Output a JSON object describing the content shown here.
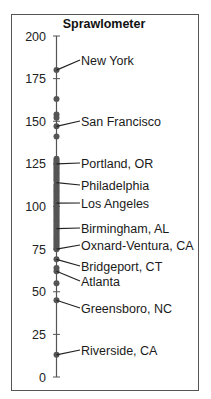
{
  "chart_data": {
    "type": "scatter",
    "orientation": "vertical-strip",
    "title": "Sprawlometer",
    "xlabel": "",
    "ylabel": "",
    "ylim": [
      0,
      200
    ],
    "yticks": [
      0,
      25,
      50,
      75,
      100,
      125,
      150,
      175,
      200
    ],
    "grid": false,
    "legend": null,
    "points": [
      180,
      163,
      154,
      152,
      147,
      141,
      128,
      127,
      126,
      125,
      124,
      123,
      122,
      121,
      120,
      119,
      118,
      117,
      116,
      115,
      113,
      112,
      111,
      110,
      109,
      108,
      107,
      106,
      105,
      104,
      103,
      102,
      101,
      100,
      99,
      98,
      97,
      96,
      95,
      94,
      93,
      92,
      91,
      90,
      89,
      88,
      87,
      86,
      85,
      84,
      83,
      82,
      81,
      80,
      79,
      78,
      77,
      76,
      75,
      69,
      64,
      62,
      55,
      45,
      13
    ],
    "annotations": [
      {
        "label": "New York",
        "value": 180,
        "label_y": 60
      },
      {
        "label": "San Francisco",
        "value": 147,
        "label_y": 121
      },
      {
        "label": "Portland, OR",
        "value": 125,
        "label_y": 163
      },
      {
        "label": "Philadelphia",
        "value": 114,
        "label_y": 185
      },
      {
        "label": "Los Angeles",
        "value": 102,
        "label_y": 203
      },
      {
        "label": "Birmingham, AL",
        "value": 87,
        "label_y": 228
      },
      {
        "label": "Oxnard-Ventura, CA",
        "value": 75,
        "label_y": 245
      },
      {
        "label": "Bridgeport, CT",
        "value": 69,
        "label_y": 266
      },
      {
        "label": "Atlanta",
        "value": 62,
        "label_y": 281
      },
      {
        "label": "Greensboro, NC",
        "value": 45,
        "label_y": 308
      },
      {
        "label": "Riverside, CA",
        "value": 13,
        "label_y": 350
      }
    ]
  },
  "style": {
    "axis_color": "#555555",
    "point_color": "#555555",
    "frame_color": "#555555",
    "text_color": "#1a1a1a"
  }
}
